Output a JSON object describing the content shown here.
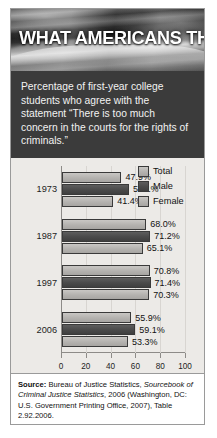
{
  "banner": {
    "title": "WHAT AMERICANS THINK"
  },
  "subtitle": {
    "text": "Percentage of first-year college students who agree with the statement “There is too much concern in the courts for the rights of criminals.”"
  },
  "legend": {
    "items": [
      {
        "label": "Total",
        "color": "#b4b2af"
      },
      {
        "label": "Male",
        "color": "#4a4a4a"
      },
      {
        "label": "Female",
        "color": "#b4b2af"
      }
    ]
  },
  "source": {
    "label": "Source:",
    "part1": " Bureau of Justice Statistics, ",
    "italic": "Sourcebook of Criminal Justice Statistics",
    "part2": ", 2006 (Washington, DC: U.S. Government Printing Office, 2007), Table 2.92.2006."
  },
  "chart_data": {
    "type": "bar",
    "orientation": "horizontal",
    "title": "WHAT AMERICANS THINK",
    "subtitle": "Percentage of first-year college students who agree with the statement “There is too much concern in the courts for the rights of criminals.”",
    "categories": [
      "1973",
      "1987",
      "1997",
      "2006"
    ],
    "series": [
      {
        "name": "Total",
        "values": [
          47.9,
          68.0,
          70.8,
          55.9
        ],
        "labels": [
          "47.9%",
          "68.0%",
          "70.8%",
          "55.9%"
        ],
        "color": "#b4b2af"
      },
      {
        "name": "Male",
        "values": [
          54.1,
          71.2,
          71.4,
          59.1
        ],
        "labels": [
          "54.1%",
          "71.2%",
          "71.4%",
          "59.1%"
        ],
        "color": "#4a4a4a"
      },
      {
        "name": "Female",
        "values": [
          41.4,
          65.1,
          70.3,
          53.3
        ],
        "labels": [
          "41.4%",
          "65.1%",
          "70.3%",
          "53.3%"
        ],
        "color": "#b4b2af"
      }
    ],
    "xlabel": "",
    "ylabel": "",
    "xlim": [
      0,
      100
    ],
    "xticks": [
      0,
      20,
      40,
      60,
      80,
      100
    ],
    "xtick_labels": [
      "0",
      "20",
      "40",
      "60",
      "80",
      "100"
    ],
    "grid": true,
    "legend_position": "top-right"
  }
}
